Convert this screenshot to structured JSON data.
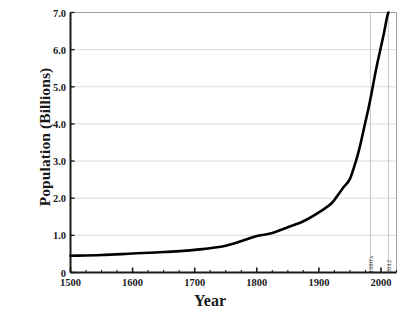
{
  "chart_data": {
    "type": "line",
    "title": "",
    "xlabel": "Year",
    "ylabel": "Population (Billions)",
    "xlim": [
      1500,
      2025
    ],
    "ylim": [
      0,
      7.0
    ],
    "grid": true,
    "legend": "none",
    "xticks": [
      1500,
      1600,
      1700,
      1800,
      1900,
      2000
    ],
    "xtick_labels": [
      "1500",
      "1600",
      "1700",
      "1800",
      "1900",
      "2000"
    ],
    "xtick_minor_step": 25,
    "yticks": [
      0,
      1.0,
      2.0,
      3.0,
      4.0,
      5.0,
      6.0,
      7.0
    ],
    "ytick_labels": [
      "0",
      "1.0",
      "2.0",
      "3.0",
      "4.0",
      "5.0",
      "6.0",
      "7.0"
    ],
    "series": [
      {
        "name": "World Population",
        "color": "#000000",
        "x": [
          1500,
          1550,
          1600,
          1650,
          1700,
          1750,
          1800,
          1820,
          1850,
          1875,
          1900,
          1920,
          1930,
          1940,
          1950,
          1960,
          1965,
          1970,
          1975,
          1980,
          1985,
          1990,
          1995,
          2000,
          2005,
          2010,
          2012
        ],
        "values": [
          0.45,
          0.47,
          0.51,
          0.55,
          0.61,
          0.72,
          0.98,
          1.04,
          1.22,
          1.38,
          1.62,
          1.86,
          2.07,
          2.3,
          2.52,
          3.02,
          3.32,
          3.68,
          4.06,
          4.43,
          4.84,
          5.29,
          5.7,
          6.08,
          6.46,
          6.89,
          7.0
        ]
      }
    ],
    "annotations": [
      {
        "label": "1980's",
        "x": 1983,
        "style": "vertical-line"
      },
      {
        "label": "2012",
        "x": 2012,
        "style": "vertical-line"
      }
    ]
  }
}
